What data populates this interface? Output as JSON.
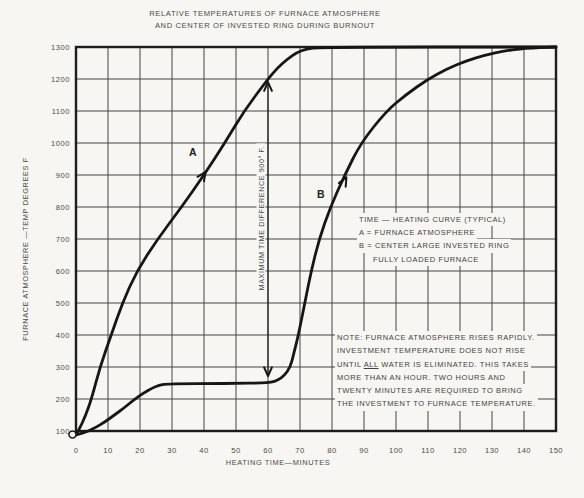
{
  "figure": {
    "title_line1": "RELATIVE TEMPERATURES OF FURNACE ATMOSPHERE",
    "title_line2": "AND CENTER OF INVESTED RING DURING BURNOUT"
  },
  "axes": {
    "y_title": "FURNACE ATMOSPHERE —TEMP DEGREES F",
    "x_title": "HEATING TIME—MINUTES"
  },
  "legend": {
    "line1": "TIME — HEATING CURVE (TYPICAL)",
    "line2": "A = FURNACE ATMOSPHERE",
    "line3": "B = CENTER LARGE INVESTED RING",
    "line4": "FULLY LOADED FURNACE"
  },
  "note": {
    "line1": "NOTE: FURNACE ATMOSPHERE RISES RAPIDLY.",
    "line2": "INVESTMENT TEMPERATURE DOES NOT RISE",
    "line3_pre": "UNTIL ",
    "line3_underlined": "ALL",
    "line3_post": " WATER IS ELIMINATED. THIS TAKES",
    "line4": "MORE THAN AN HOUR. TWO HOURS AND",
    "line5": "TWENTY MINUTES ARE REQUIRED TO BRING",
    "line6": "THE INVESTMENT TO FURNACE TEMPERATURE.",
    "colors": {
      "ink": "#424242",
      "paper": "#f7f6f2"
    }
  },
  "annotations": {
    "curve_a_label": {
      "text": "A",
      "x_min": 36.5,
      "y_f": 965
    },
    "curve_a_arrow": {
      "x_min": 40.5,
      "y_f": 910,
      "angle_deg": -56
    },
    "curve_b_label": {
      "text": "B",
      "x_min": 76.5,
      "y_f": 840
    },
    "curve_b_arrow": {
      "x_min": 84.5,
      "y_f": 893,
      "angle_deg": -62
    },
    "dimension": {
      "label": "MAXIMUM TIME DIFFERENCE 900° F.",
      "x_min": 60,
      "y_top_f": 1190,
      "y_bottom_f": 272
    }
  },
  "chart_data": {
    "type": "line",
    "title": "RELATIVE TEMPERATURES OF FURNACE ATMOSPHERE AND CENTER OF INVESTED RING DURING BURNOUT",
    "xlabel": "HEATING TIME—MINUTES",
    "ylabel": "FURNACE ATMOSPHERE —TEMP DEGREES F",
    "xlim": [
      0,
      150
    ],
    "ylim": [
      100,
      1300
    ],
    "x_ticks": [
      0,
      10,
      20,
      30,
      40,
      50,
      60,
      70,
      80,
      90,
      100,
      110,
      120,
      130,
      140,
      150
    ],
    "y_ticks": [
      100,
      200,
      300,
      400,
      500,
      600,
      700,
      800,
      900,
      1000,
      1100,
      1200,
      1300
    ],
    "grid": true,
    "legend_position": "right-middle",
    "series": [
      {
        "name": "A = FURNACE ATMOSPHERE",
        "points": [
          [
            0,
            88
          ],
          [
            1,
            105
          ],
          [
            3,
            148
          ],
          [
            5,
            205
          ],
          [
            7.5,
            300
          ],
          [
            11,
            400
          ],
          [
            14.5,
            500
          ],
          [
            19,
            600
          ],
          [
            25.5,
            700
          ],
          [
            33,
            800
          ],
          [
            40,
            900
          ],
          [
            46.5,
            1000
          ],
          [
            52.5,
            1100
          ],
          [
            60,
            1200
          ],
          [
            63,
            1235
          ],
          [
            66,
            1262
          ],
          [
            69,
            1283
          ],
          [
            72,
            1294
          ],
          [
            76,
            1300
          ],
          [
            150,
            1300
          ]
        ]
      },
      {
        "name": "B = CENTER LARGE INVESTED RING, FULLY LOADED FURNACE",
        "points": [
          [
            0,
            88
          ],
          [
            3,
            96
          ],
          [
            6,
            110
          ],
          [
            9,
            128
          ],
          [
            12,
            150
          ],
          [
            15,
            172
          ],
          [
            18,
            197
          ],
          [
            21,
            218
          ],
          [
            24,
            235
          ],
          [
            26,
            243
          ],
          [
            28,
            247
          ],
          [
            34,
            248
          ],
          [
            42,
            248
          ],
          [
            50,
            249
          ],
          [
            58,
            250
          ],
          [
            61,
            252
          ],
          [
            63,
            258
          ],
          [
            65,
            272
          ],
          [
            67,
            300
          ],
          [
            68,
            340
          ],
          [
            69.5,
            400
          ],
          [
            71.5,
            500
          ],
          [
            73.5,
            600
          ],
          [
            76,
            700
          ],
          [
            79.5,
            800
          ],
          [
            84,
            900
          ],
          [
            89,
            1000
          ],
          [
            97,
            1100
          ],
          [
            103,
            1150
          ],
          [
            110,
            1200
          ],
          [
            116,
            1232
          ],
          [
            122,
            1257
          ],
          [
            128,
            1275
          ],
          [
            134,
            1288
          ],
          [
            140,
            1296
          ],
          [
            150,
            1300
          ]
        ]
      }
    ]
  }
}
